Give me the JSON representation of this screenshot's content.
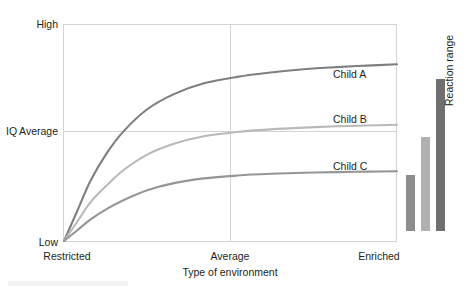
{
  "chart_data": {
    "type": "line",
    "title": "",
    "xlabel": "Type of environment",
    "ylabel": "IQ",
    "x_tick_labels": [
      "Restricted",
      "Average",
      "Enriched"
    ],
    "y_tick_labels": [
      "Low",
      "Average",
      "High"
    ],
    "xlim": [
      0,
      1
    ],
    "ylim": [
      0,
      1
    ],
    "grid": true,
    "legend_position": "inline-right",
    "series": [
      {
        "name": "Child A",
        "color": "#7f7f7f",
        "x": [
          0.0,
          0.04,
          0.08,
          0.13,
          0.18,
          0.25,
          0.33,
          0.42,
          0.52,
          0.62,
          0.72,
          0.82,
          0.91,
          1.0
        ],
        "values": [
          0.0,
          0.14,
          0.28,
          0.41,
          0.51,
          0.61,
          0.68,
          0.73,
          0.76,
          0.78,
          0.795,
          0.805,
          0.812,
          0.818
        ]
      },
      {
        "name": "Child B",
        "color": "#b9b9b9",
        "x": [
          0.0,
          0.04,
          0.08,
          0.13,
          0.18,
          0.25,
          0.33,
          0.42,
          0.52,
          0.62,
          0.72,
          0.82,
          0.91,
          1.0
        ],
        "values": [
          0.0,
          0.09,
          0.18,
          0.26,
          0.33,
          0.4,
          0.45,
          0.485,
          0.505,
          0.517,
          0.525,
          0.531,
          0.535,
          0.538
        ]
      },
      {
        "name": "Child C",
        "color": "#959595",
        "x": [
          0.0,
          0.04,
          0.08,
          0.13,
          0.18,
          0.25,
          0.33,
          0.42,
          0.52,
          0.62,
          0.72,
          0.82,
          0.91,
          1.0
        ],
        "values": [
          0.0,
          0.05,
          0.1,
          0.15,
          0.19,
          0.235,
          0.268,
          0.29,
          0.303,
          0.311,
          0.316,
          0.319,
          0.321,
          0.323
        ]
      }
    ],
    "reaction_range": {
      "title": "Reaction range",
      "bars": [
        {
          "name": "Child C",
          "color": "#8d8d8d",
          "low": 0.046,
          "high": 0.308
        },
        {
          "name": "Child B",
          "color": "#b0b0b0",
          "low": 0.046,
          "high": 0.482
        },
        {
          "name": "Child A",
          "color": "#6f6f6f",
          "low": 0.046,
          "high": 0.752
        }
      ]
    }
  },
  "axes": {
    "y": {
      "title": "IQ",
      "high": "High",
      "average": "Average",
      "low": "Low"
    },
    "x": {
      "title": "Type of environment",
      "restricted": "Restricted",
      "average": "Average",
      "enriched": "Enriched"
    }
  },
  "series_labels": {
    "child_a": "Child A",
    "child_b": "Child B",
    "child_c": "Child C"
  },
  "reaction_range_label": "Reaction range",
  "colors": {
    "child_a": "#7f7f7f",
    "child_b": "#b9b9b9",
    "child_c": "#959595",
    "bar_a": "#6f6f6f",
    "bar_b": "#b0b0b0",
    "bar_c": "#8d8d8d",
    "grid": "#d4d4d4",
    "text": "#231f20"
  }
}
